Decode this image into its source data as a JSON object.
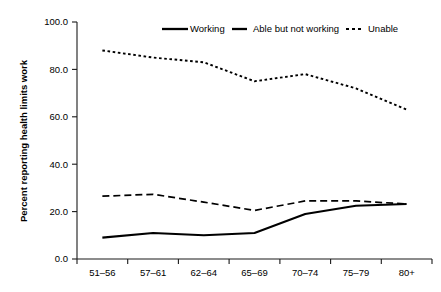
{
  "chart_data": {
    "type": "line",
    "title": "",
    "xlabel": "",
    "ylabel": "Percent reporting health limits work",
    "categories": [
      "51–56",
      "57–61",
      "62–64",
      "65–69",
      "70–74",
      "75–79",
      "80+"
    ],
    "ylim": [
      0,
      100
    ],
    "yticks": [
      0,
      20,
      40,
      60,
      80,
      100
    ],
    "ytick_labels": [
      "0.0",
      "20.0",
      "40.0",
      "60.0",
      "80.0",
      "100.0"
    ],
    "grid": false,
    "legend_position": "top",
    "series": [
      {
        "name": "Working",
        "style": "solid",
        "color": "#000000",
        "values": [
          9.0,
          11.0,
          10.0,
          11.0,
          19.0,
          22.5,
          23.2
        ]
      },
      {
        "name": "Able but not working",
        "style": "dashed",
        "color": "#000000",
        "values": [
          26.5,
          27.3,
          24.0,
          20.5,
          24.5,
          24.5,
          23.2
        ]
      },
      {
        "name": "Unable",
        "style": "dotted",
        "color": "#000000",
        "values": [
          88.0,
          85.0,
          83.0,
          75.0,
          78.0,
          72.0,
          63.0
        ]
      }
    ]
  },
  "legend": {
    "items": [
      {
        "label": "Working"
      },
      {
        "label": "Able but not working"
      },
      {
        "label": "Unable"
      }
    ]
  }
}
